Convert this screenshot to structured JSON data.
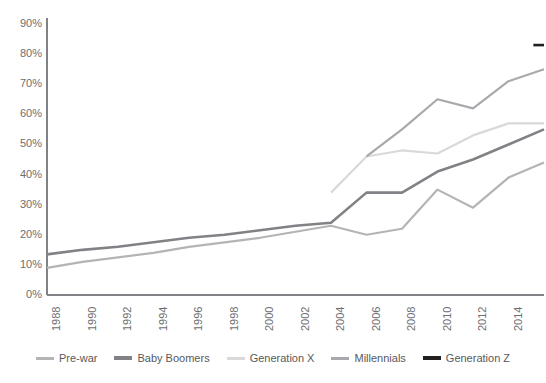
{
  "chart_data": {
    "type": "line",
    "title": "",
    "xlabel": "",
    "ylabel": "",
    "x": [
      1988,
      1990,
      1992,
      1994,
      1996,
      1998,
      2000,
      2002,
      2004,
      2006,
      2008,
      2010,
      2012,
      2014,
      2016
    ],
    "categories": [
      "1988",
      "1990",
      "1992",
      "1994",
      "1996",
      "1998",
      "2000",
      "2002",
      "2004",
      "2006",
      "2008",
      "2010",
      "2012",
      "2014",
      "2016"
    ],
    "ylim": [
      0,
      90
    ],
    "yticks": [
      0,
      10,
      20,
      30,
      40,
      50,
      60,
      70,
      80,
      90
    ],
    "ytick_labels": [
      "0%",
      "10%",
      "20%",
      "30%",
      "40%",
      "50%",
      "60%",
      "70%",
      "80%",
      "90%"
    ],
    "grid": false,
    "legend_position": "bottom",
    "series": [
      {
        "name": "Pre-war",
        "color": "#b4b4b4",
        "x": [
          1988,
          1990,
          1992,
          1994,
          1996,
          1998,
          2000,
          2002,
          2004,
          2006,
          2008,
          2010,
          2012,
          2014,
          2016
        ],
        "values": [
          9,
          11,
          12.5,
          14,
          16,
          17.5,
          19,
          21,
          23,
          20,
          22,
          35,
          29,
          39,
          44
        ]
      },
      {
        "name": "Baby Boomers",
        "color": "#808285",
        "x": [
          1988,
          1990,
          1992,
          1994,
          1996,
          1998,
          2000,
          2002,
          2004,
          2006,
          2008,
          2010,
          2012,
          2014,
          2016
        ],
        "values": [
          13.5,
          15,
          16,
          17.5,
          19,
          20,
          21.5,
          23,
          24,
          34,
          34,
          41,
          45,
          50,
          55
        ]
      },
      {
        "name": "Generation X",
        "color": "#d9d9d9",
        "x": [
          2004,
          2006,
          2008,
          2010,
          2012,
          2014,
          2016
        ],
        "values": [
          34,
          46,
          48,
          47,
          53,
          57,
          57
        ]
      },
      {
        "name": "Millennials",
        "color": "#a7a9ac",
        "x": [
          2006,
          2008,
          2010,
          2012,
          2014,
          2016
        ],
        "values": [
          46,
          55,
          65,
          62,
          71,
          75
        ]
      },
      {
        "name": "Generation Z",
        "color": "#231f20",
        "x": [
          2015.4,
          2016
        ],
        "values": [
          83,
          83
        ]
      }
    ]
  },
  "axes": {
    "axis_color": "#808285",
    "y_ticks": [
      {
        "label": "90%",
        "value": 90
      },
      {
        "label": "80%",
        "value": 80
      },
      {
        "label": "70%",
        "value": 70
      },
      {
        "label": "60%",
        "value": 60
      },
      {
        "label": "50%",
        "value": 50
      },
      {
        "label": "40%",
        "value": 40
      },
      {
        "label": "30%",
        "value": 30
      },
      {
        "label": "20%",
        "value": 20
      },
      {
        "label": "10%",
        "value": 10
      },
      {
        "label": "0%",
        "value": 0
      }
    ],
    "x_ticks": [
      {
        "label": "1988",
        "value": 1988
      },
      {
        "label": "1990",
        "value": 1990
      },
      {
        "label": "1992",
        "value": 1992
      },
      {
        "label": "1994",
        "value": 1994
      },
      {
        "label": "1996",
        "value": 1996
      },
      {
        "label": "1998",
        "value": 1998
      },
      {
        "label": "2000",
        "value": 2000
      },
      {
        "label": "2002",
        "value": 2002
      },
      {
        "label": "2004",
        "value": 2004
      },
      {
        "label": "2006",
        "value": 2006
      },
      {
        "label": "2008",
        "value": 2008
      },
      {
        "label": "2010",
        "value": 2010
      },
      {
        "label": "2012",
        "value": 2012
      },
      {
        "label": "2014",
        "value": 2014
      },
      {
        "label": "2016",
        "value": 2016
      }
    ]
  },
  "legend": {
    "items": [
      {
        "label": "Pre-war",
        "color": "#b4b4b4",
        "width": 3
      },
      {
        "label": "Baby Boomers",
        "color": "#808285",
        "width": 4
      },
      {
        "label": "Generation X",
        "color": "#d9d9d9",
        "width": 3
      },
      {
        "label": "Millennials",
        "color": "#a7a9ac",
        "width": 3
      },
      {
        "label": "Generation Z",
        "color": "#231f20",
        "width": 4
      }
    ]
  }
}
